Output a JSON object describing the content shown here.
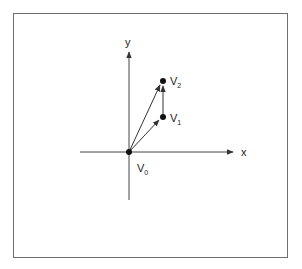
{
  "diagram": {
    "axes": {
      "x_label": "x",
      "y_label": "y"
    },
    "points": [
      {
        "name": "V",
        "sub": "0",
        "role": "origin"
      },
      {
        "name": "V",
        "sub": "1"
      },
      {
        "name": "V",
        "sub": "2"
      }
    ],
    "vectors": [
      {
        "from": "V0",
        "to": "V1"
      },
      {
        "from": "V0",
        "to": "V2"
      },
      {
        "from": "V1",
        "to": "V2"
      }
    ],
    "colors": {
      "line": "#333333",
      "frame": "#6e6e6e"
    }
  }
}
